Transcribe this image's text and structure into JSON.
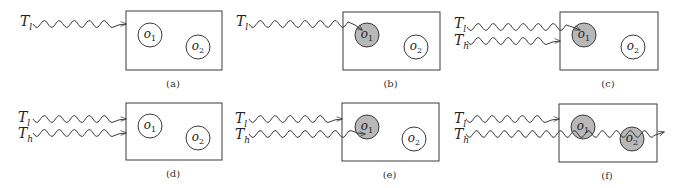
{
  "figure": {
    "panels": [
      {
        "id": "a",
        "caption": "(a)",
        "box": {
          "x": 126,
          "y": 11,
          "w": 96,
          "h": 59
        },
        "objects": [
          {
            "name": "o",
            "sub": "1",
            "cx": 150,
            "cy": 35,
            "r": 12,
            "shaded": false
          },
          {
            "name": "o",
            "sub": "2",
            "cx": 198,
            "cy": 47,
            "r": 12,
            "shaded": false
          }
        ],
        "transactions": [
          {
            "name": "T",
            "sub": "l",
            "label_x": 20,
            "label_y": 13,
            "wave_y": 24,
            "start_x": 33,
            "end_x": 126,
            "end_y": 24
          }
        ]
      },
      {
        "id": "b",
        "caption": "(b)",
        "box": {
          "x": 343,
          "y": 12,
          "w": 97,
          "h": 58
        },
        "objects": [
          {
            "name": "o",
            "sub": "1",
            "cx": 367,
            "cy": 35,
            "r": 12,
            "shaded": true
          },
          {
            "name": "o",
            "sub": "2",
            "cx": 416,
            "cy": 47,
            "r": 12,
            "shaded": false
          }
        ],
        "transactions": [
          {
            "name": "T",
            "sub": "l",
            "label_x": 236,
            "label_y": 13,
            "wave_y": 24,
            "start_x": 249,
            "end_x": 362,
            "end_y": 30
          }
        ]
      },
      {
        "id": "c",
        "caption": "(c)",
        "box": {
          "x": 560,
          "y": 12,
          "w": 98,
          "h": 58
        },
        "objects": [
          {
            "name": "o",
            "sub": "1",
            "cx": 584,
            "cy": 35,
            "r": 12,
            "shaded": true
          },
          {
            "name": "o",
            "sub": "2",
            "cx": 633,
            "cy": 47,
            "r": 12,
            "shaded": false
          }
        ],
        "transactions": [
          {
            "name": "T",
            "sub": "l",
            "label_x": 454,
            "label_y": 15,
            "wave_y": 27,
            "start_x": 467,
            "end_x": 580,
            "end_y": 30
          },
          {
            "name": "T",
            "sub": "h",
            "label_x": 454,
            "label_y": 32,
            "wave_y": 41,
            "start_x": 467,
            "end_x": 560,
            "end_y": 41
          }
        ]
      },
      {
        "id": "d",
        "caption": "(d)",
        "box": {
          "x": 126,
          "y": 103,
          "w": 96,
          "h": 57
        },
        "objects": [
          {
            "name": "o",
            "sub": "1",
            "cx": 150,
            "cy": 126,
            "r": 12,
            "shaded": false
          },
          {
            "name": "o",
            "sub": "2",
            "cx": 198,
            "cy": 138,
            "r": 12,
            "shaded": false
          }
        ],
        "transactions": [
          {
            "name": "T",
            "sub": "l",
            "label_x": 18,
            "label_y": 109,
            "wave_y": 119,
            "start_x": 33,
            "end_x": 126,
            "end_y": 119
          },
          {
            "name": "T",
            "sub": "h",
            "label_x": 18,
            "label_y": 125,
            "wave_y": 133,
            "start_x": 33,
            "end_x": 126,
            "end_y": 133
          }
        ]
      },
      {
        "id": "e",
        "caption": "(e)",
        "box": {
          "x": 342,
          "y": 103,
          "w": 97,
          "h": 58
        },
        "objects": [
          {
            "name": "o",
            "sub": "1",
            "cx": 367,
            "cy": 127,
            "r": 12,
            "shaded": true
          },
          {
            "name": "o",
            "sub": "2",
            "cx": 414,
            "cy": 139,
            "r": 12,
            "shaded": false
          }
        ],
        "transactions": [
          {
            "name": "T",
            "sub": "l",
            "label_x": 235,
            "label_y": 110,
            "wave_y": 119,
            "start_x": 249,
            "end_x": 342,
            "end_y": 119
          },
          {
            "name": "T",
            "sub": "h",
            "label_x": 235,
            "label_y": 126,
            "wave_y": 134,
            "start_x": 249,
            "end_x": 365,
            "end_y": 134
          }
        ]
      },
      {
        "id": "f",
        "caption": "(f)",
        "box": {
          "x": 559,
          "y": 104,
          "w": 98,
          "h": 58
        },
        "objects": [
          {
            "name": "o",
            "sub": "1",
            "cx": 583,
            "cy": 127,
            "r": 12,
            "shaded": true
          },
          {
            "name": "o",
            "sub": "2",
            "cx": 632,
            "cy": 139,
            "r": 12,
            "shaded": true
          }
        ],
        "transactions": [
          {
            "name": "T",
            "sub": "l",
            "label_x": 454,
            "label_y": 110,
            "wave_y": 119,
            "start_x": 466,
            "end_x": 559,
            "end_y": 119
          },
          {
            "name": "T",
            "sub": "h",
            "label_x": 454,
            "label_y": 126,
            "wave_y": 134,
            "start_x": 466,
            "end_x": 664,
            "end_y": 132,
            "passes_through": true
          }
        ]
      }
    ],
    "colors": {
      "stroke": "#3a3a3a",
      "shaded_fill": "#b8b8b8",
      "empty_fill": "#ffffff",
      "background": "#ffffff"
    }
  }
}
